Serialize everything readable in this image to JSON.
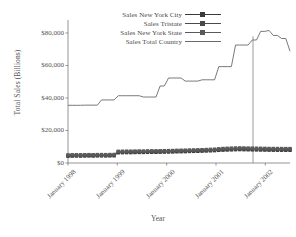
{
  "chart_data": {
    "type": "line",
    "title": "",
    "xlabel": "Year",
    "ylabel": "Total Sales (Billions)",
    "ylim": [
      0,
      88000
    ],
    "yticks": [
      0,
      20000,
      40000,
      60000,
      80000
    ],
    "ytick_labels": [
      "$0",
      "$20,000",
      "$40,000",
      "$60,000",
      "$80,000"
    ],
    "xlim": [
      0,
      54
    ],
    "xticks": [
      0,
      12,
      24,
      36,
      48
    ],
    "xtick_labels": [
      "January 1998",
      "January 1999",
      "January 2000",
      "January 2001",
      "January 2002"
    ],
    "grid": false,
    "legend_position": "top-center",
    "annotations": [
      {
        "name": "vertical-reference-line",
        "x": 45,
        "y_from": 0,
        "y_to": 78000
      }
    ],
    "series": [
      {
        "name": "Sales New York City",
        "marker": "square",
        "color": "#3a3a3a",
        "values": [
          4200,
          4250,
          4300,
          4280,
          4320,
          4350,
          4300,
          4380,
          4400,
          4360,
          4420,
          4450,
          6300,
          6350,
          6400,
          6380,
          6450,
          6500,
          6480,
          6550,
          6600,
          6580,
          6650,
          6700,
          6750,
          6800,
          6900,
          6950,
          7000,
          7100,
          7150,
          7200,
          7300,
          7400,
          7500,
          7600,
          7800,
          7900,
          8000,
          8100,
          8200,
          8250,
          8200,
          8150,
          8100,
          8050,
          8000,
          7950,
          7900,
          7880,
          7860,
          7850,
          7840,
          7830
        ]
      },
      {
        "name": "Sales Tristate",
        "marker": "square",
        "color": "#4a4a4a",
        "values": [
          4600,
          4650,
          4700,
          4680,
          4720,
          4760,
          4700,
          4780,
          4800,
          4760,
          4820,
          4860,
          6800,
          6850,
          6900,
          6880,
          6950,
          7000,
          6980,
          7050,
          7100,
          7080,
          7150,
          7200,
          7250,
          7300,
          7400,
          7450,
          7500,
          7600,
          7650,
          7700,
          7800,
          7900,
          8000,
          8100,
          8300,
          8450,
          8550,
          8650,
          8750,
          8800,
          8750,
          8700,
          8650,
          8600,
          8550,
          8500,
          8450,
          8430,
          8410,
          8400,
          8390,
          8380
        ]
      },
      {
        "name": "Sales New York State",
        "marker": "square",
        "color": "#5a5a5a",
        "values": [
          5000,
          5050,
          5100,
          5080,
          5120,
          5160,
          5100,
          5180,
          5200,
          5160,
          5220,
          5260,
          7200,
          7250,
          7300,
          7280,
          7350,
          7400,
          7380,
          7450,
          7500,
          7480,
          7550,
          7600,
          7650,
          7700,
          7800,
          7850,
          7900,
          8000,
          8050,
          8100,
          8200,
          8300,
          8400,
          8500,
          8750,
          8950,
          9050,
          9150,
          9250,
          9300,
          9250,
          9200,
          9150,
          9100,
          9050,
          9000,
          8950,
          8930,
          8910,
          8900,
          8890,
          8880
        ]
      },
      {
        "name": "Sales Total Country",
        "marker": "none",
        "color": "#6a6a6a",
        "values": [
          35500,
          35500,
          35500,
          35500,
          35600,
          35600,
          35600,
          35600,
          38800,
          38800,
          38800,
          38800,
          41400,
          41400,
          41400,
          41400,
          41400,
          41400,
          40600,
          40600,
          40600,
          40600,
          47400,
          47400,
          52300,
          52300,
          52300,
          52300,
          50400,
          50400,
          50400,
          50400,
          51200,
          51200,
          51200,
          51200,
          59300,
          59300,
          59300,
          59300,
          72600,
          72600,
          72600,
          72600,
          75700,
          75700,
          81000,
          81000,
          81600,
          78500,
          78500,
          76600,
          76600,
          68800
        ]
      }
    ]
  },
  "legend": {
    "entries": [
      {
        "label": "Sales New York City"
      },
      {
        "label": "Sales Tristate"
      },
      {
        "label": "Sales New York State"
      },
      {
        "label": "Sales Total Country"
      }
    ]
  }
}
